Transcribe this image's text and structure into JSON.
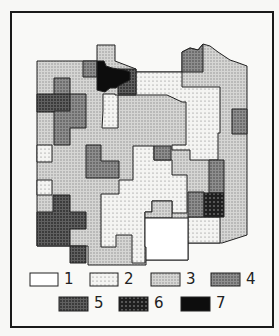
{
  "map": {
    "title": "",
    "classes": [
      {
        "id": 1,
        "label": "1",
        "fill": "#ffffff",
        "pattern": "none"
      },
      {
        "id": 2,
        "label": "2",
        "fill": "#f2f2f2",
        "pattern": "sparse-dots"
      },
      {
        "id": 3,
        "label": "3",
        "fill": "#cfcfcf",
        "pattern": "fine-dots"
      },
      {
        "id": 4,
        "label": "4",
        "fill": "#8a8a8a",
        "pattern": "medium-dots"
      },
      {
        "id": 5,
        "label": "5",
        "fill": "#5a5a5a",
        "pattern": "dense-dots"
      },
      {
        "id": 6,
        "label": "6",
        "fill": "#2a2a2a",
        "pattern": "dark-with-light-dots"
      },
      {
        "id": 7,
        "label": "7",
        "fill": "#0d0d0d",
        "pattern": "solid"
      }
    ]
  },
  "legend": {
    "row1": [
      {
        "label": "1"
      },
      {
        "label": "2"
      },
      {
        "label": "3"
      },
      {
        "label": "4"
      }
    ],
    "row2": [
      {
        "label": "5"
      },
      {
        "label": "6"
      },
      {
        "label": "7"
      }
    ]
  }
}
